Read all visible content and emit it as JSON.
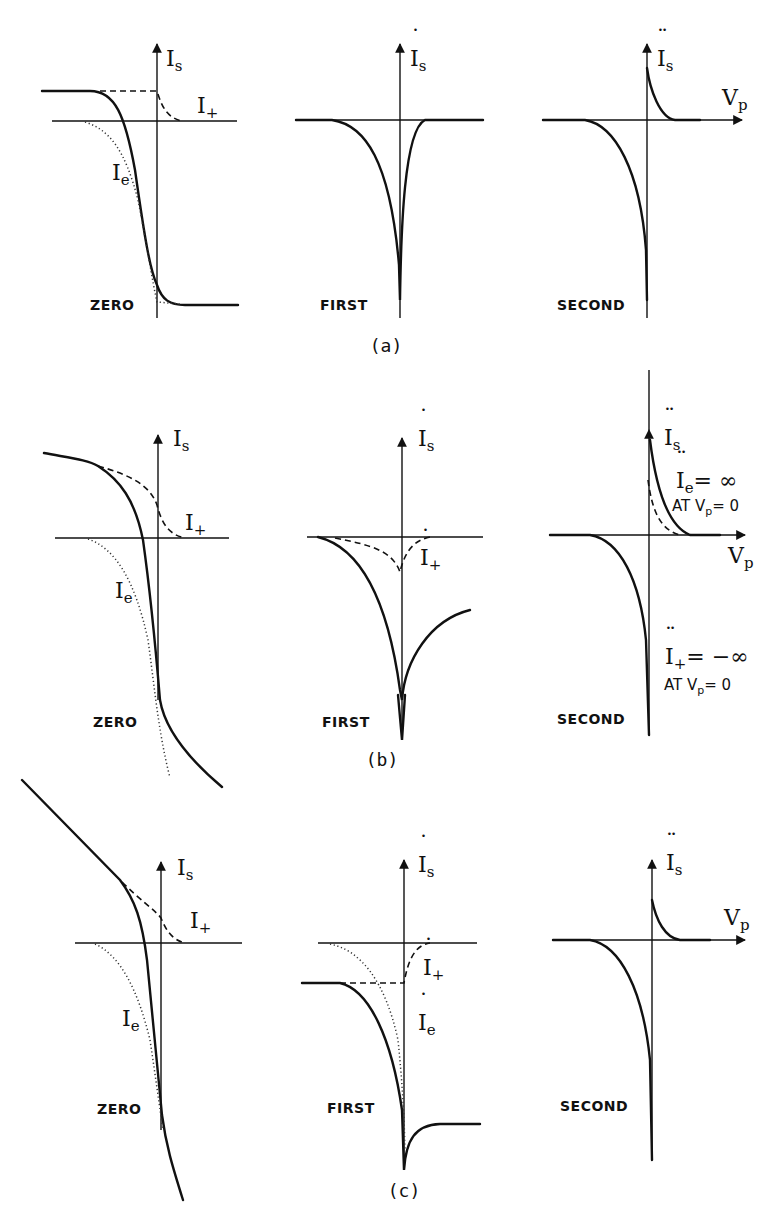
{
  "figure": {
    "panels": [
      {
        "id": "a",
        "caption": "(a)",
        "columns": [
          {
            "order_label": "ZERO",
            "y_axis_label": "I",
            "y_axis_sub": "s",
            "y_axis_dots": "",
            "curve_labels": [
              {
                "main": "I",
                "sub": "+",
                "dots": ""
              },
              {
                "main": "I",
                "sub": "e",
                "dots": ""
              }
            ]
          },
          {
            "order_label": "FIRST",
            "y_axis_label": "I",
            "y_axis_sub": "s",
            "y_axis_dots": "˙",
            "curve_labels": []
          },
          {
            "order_label": "SECOND",
            "y_axis_label": "I",
            "y_axis_sub": "s",
            "y_axis_dots": "¨",
            "x_axis_label": "V",
            "x_axis_sub": "p",
            "curve_labels": []
          }
        ]
      },
      {
        "id": "b",
        "caption": "(b)",
        "columns": [
          {
            "order_label": "ZERO",
            "y_axis_label": "I",
            "y_axis_sub": "s",
            "y_axis_dots": "",
            "curve_labels": [
              {
                "main": "I",
                "sub": "+",
                "dots": ""
              },
              {
                "main": "I",
                "sub": "e",
                "dots": ""
              }
            ]
          },
          {
            "order_label": "FIRST",
            "y_axis_label": "I",
            "y_axis_sub": "s",
            "y_axis_dots": "˙",
            "curve_labels": [
              {
                "main": "I",
                "sub": "+",
                "dots": "˙"
              }
            ]
          },
          {
            "order_label": "SECOND",
            "y_axis_label": "I",
            "y_axis_sub": "s",
            "y_axis_dots": "¨",
            "x_axis_label": "V",
            "x_axis_sub": "p",
            "curve_labels": [
              {
                "main": "I",
                "sub": "e",
                "dots": "¨",
                "suffix": "= ∞"
              },
              {
                "main": "I",
                "sub": "+",
                "dots": "¨",
                "suffix": "= −∞"
              }
            ],
            "notes": [
              {
                "prefix": "AT V",
                "sub": "p",
                "suffix": "= 0"
              },
              {
                "prefix": "AT V",
                "sub": "p",
                "suffix": "= 0"
              }
            ]
          }
        ]
      },
      {
        "id": "c",
        "caption": "(c)",
        "columns": [
          {
            "order_label": "ZERO",
            "y_axis_label": "I",
            "y_axis_sub": "s",
            "y_axis_dots": "",
            "curve_labels": [
              {
                "main": "I",
                "sub": "+",
                "dots": ""
              },
              {
                "main": "I",
                "sub": "e",
                "dots": ""
              }
            ]
          },
          {
            "order_label": "FIRST",
            "y_axis_label": "I",
            "y_axis_sub": "s",
            "y_axis_dots": "˙",
            "curve_labels": [
              {
                "main": "I",
                "sub": "+",
                "dots": "˙"
              },
              {
                "main": "I",
                "sub": "e",
                "dots": "˙"
              }
            ]
          },
          {
            "order_label": "SECOND",
            "y_axis_label": "I",
            "y_axis_sub": "s",
            "y_axis_dots": "¨",
            "x_axis_label": "V",
            "x_axis_sub": "p",
            "curve_labels": []
          }
        ]
      }
    ],
    "legend_styles": {
      "total_current": "solid",
      "ion_current": "dashed",
      "electron_current": "dotted"
    }
  }
}
